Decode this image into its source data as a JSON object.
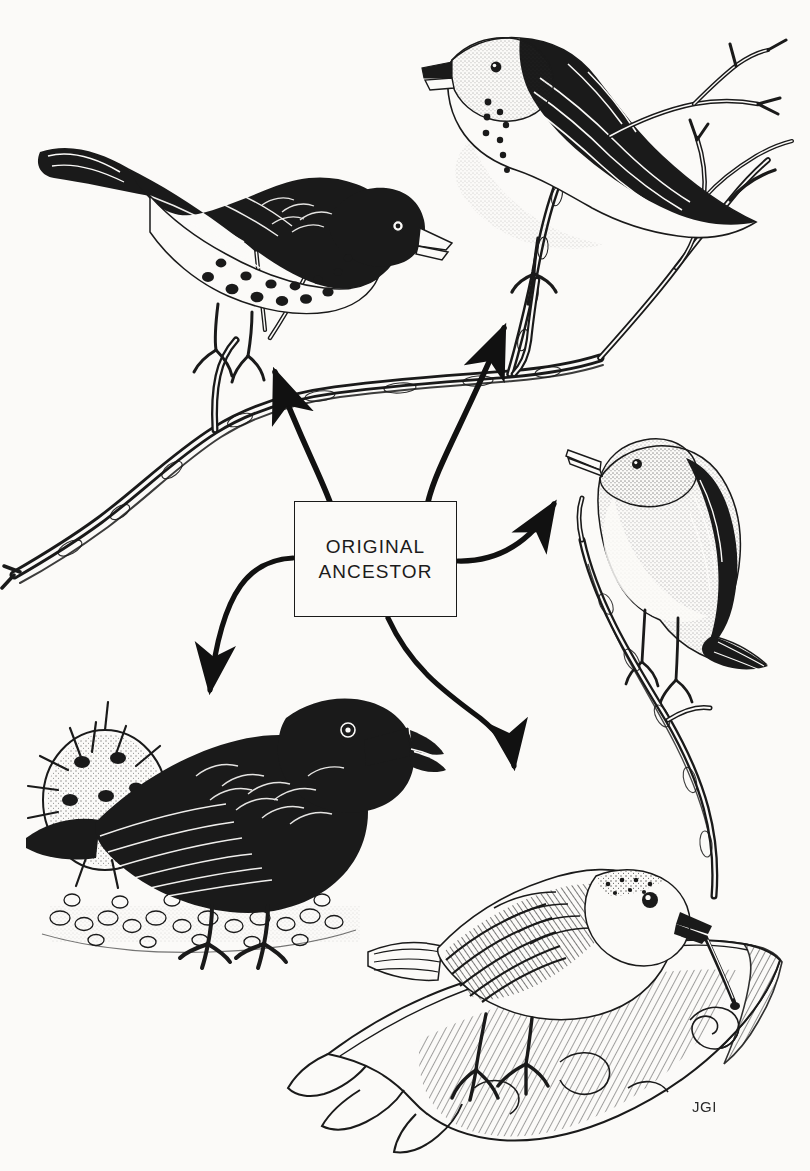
{
  "figure": {
    "background_color": "#fbfaf8",
    "ink_color": "#1a1a1a",
    "width": 810,
    "height": 1171
  },
  "central_label": {
    "name": "original-ancestor-box",
    "line1": "ORIGINAL",
    "line2": "ANCESTOR",
    "box": {
      "x": 294,
      "y": 501,
      "w": 163,
      "h": 116
    },
    "border_color": "#1a1a1a",
    "fill_color": "#fbfaf8"
  },
  "signature": {
    "text": "JGI",
    "x": 692,
    "y": 1098
  },
  "arrows": [
    {
      "name": "arrow-to-top-left-finch",
      "from": "box-top-left",
      "to": "top-left-finch",
      "direction": "up-left",
      "head_x": 268,
      "head_y": 360
    },
    {
      "name": "arrow-to-top-right-finch",
      "from": "box-top-right",
      "to": "top-right-finch",
      "direction": "up",
      "head_x": 506,
      "head_y": 313
    },
    {
      "name": "arrow-to-right-finch",
      "from": "box-right",
      "to": "right-warbler-finch",
      "direction": "up-right",
      "head_x": 560,
      "head_y": 494
    },
    {
      "name": "arrow-to-bottom-left-finch",
      "from": "box-left",
      "to": "bottom-left-ground-finch",
      "direction": "down-left",
      "head_x": 208,
      "head_y": 703
    },
    {
      "name": "arrow-to-bottom-right-finch",
      "from": "box-bottom",
      "to": "bottom-right-woodpecker-finch",
      "direction": "down-right",
      "head_x": 517,
      "head_y": 777
    }
  ],
  "birds": [
    {
      "name": "top-left-finch",
      "description": "Dark finch with spotted white belly perched on a branch, facing right",
      "facing": "right",
      "plumage": "dark with spotted belly",
      "beak": "stout conical",
      "cx": 210,
      "cy": 240
    },
    {
      "name": "top-right-finch",
      "description": "Pale-breasted finch with row of dark breast spots on a forked branch, facing left",
      "facing": "left",
      "plumage": "pale breast, dark mottled back",
      "beak": "short stout",
      "cx": 580,
      "cy": 165
    },
    {
      "name": "right-warbler-finch",
      "description": "Warbler finch with slender pointed beak perched on a vertical twig, facing left",
      "facing": "left",
      "plumage": "streaked grey-brown, pale underside",
      "beak": "slender pointed",
      "cx": 660,
      "cy": 545
    },
    {
      "name": "bottom-left-ground-finch",
      "description": "Large black ground finch with heavy beak standing on pebbles beside a spiny cactus pad",
      "facing": "right",
      "plumage": "solid black",
      "beak": "large heavy conical",
      "cx": 215,
      "cy": 800
    },
    {
      "name": "bottom-right-woodpecker-finch",
      "description": "Woodpecker finch on a log holding a cactus spine tool in its beak, facing right",
      "facing": "right",
      "plumage": "barred brown wings, pale breast",
      "beak": "straight probing, holding spine",
      "cx": 510,
      "cy": 945
    }
  ],
  "scenery": [
    {
      "name": "upper-branch",
      "description": "Lichen-textured branch sweeping from lower-left to upper-right, supporting the two top finches"
    },
    {
      "name": "vertical-twig",
      "description": "Upright twig on the right rising from the log, supporting the warbler finch"
    },
    {
      "name": "cactus-pad",
      "description": "Spiny prickly-pear pad at lower left beside the ground finch"
    },
    {
      "name": "pebble-ground",
      "description": "Stippled pebbly ground under the black ground finch"
    },
    {
      "name": "bottom-log",
      "description": "Weathered hatched log across the lower right holding the woodpecker finch"
    }
  ]
}
